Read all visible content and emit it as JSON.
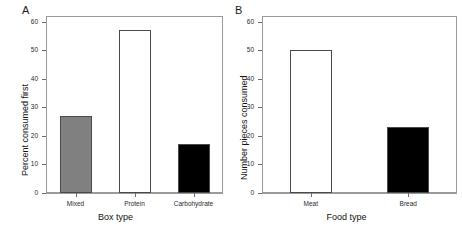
{
  "figure": {
    "background": "#ffffff",
    "panels": [
      {
        "letter": "A",
        "xlabel": "Box type",
        "ylabel": "Percent consumed first"
      },
      {
        "letter": "B",
        "xlabel": "Food type",
        "ylabel": "Number pieces consumed"
      }
    ]
  },
  "chart_data": [
    {
      "type": "bar",
      "panel": "A",
      "title": "",
      "xlabel": "Box type",
      "ylabel": "Percent consumed first",
      "categories": [
        "Mixed",
        "Protein",
        "Carbohydrate"
      ],
      "values": [
        27,
        57,
        17
      ],
      "bar_colors": [
        "#808080",
        "#ffffff",
        "#000000"
      ],
      "bar_edge_color": "#4a4a4a",
      "ylim": [
        0,
        62
      ],
      "yticks": [
        0,
        10,
        20,
        30,
        40,
        50,
        60
      ],
      "ytick_labels": [
        "0",
        "10",
        "20",
        "30",
        "40",
        "50",
        "60"
      ],
      "grid": false,
      "legend": "none"
    },
    {
      "type": "bar",
      "panel": "B",
      "title": "",
      "xlabel": "Food type",
      "ylabel": "Number pieces consumed",
      "categories": [
        "Meat",
        "Bread"
      ],
      "values": [
        50,
        23
      ],
      "bar_colors": [
        "#ffffff",
        "#000000"
      ],
      "bar_edge_color": "#4a4a4a",
      "ylim": [
        0,
        62
      ],
      "yticks": [
        0,
        10,
        20,
        30,
        40,
        50,
        60
      ],
      "ytick_labels": [
        "0",
        "10",
        "20",
        "30",
        "40",
        "50",
        "60"
      ],
      "grid": false,
      "legend": "none"
    }
  ]
}
